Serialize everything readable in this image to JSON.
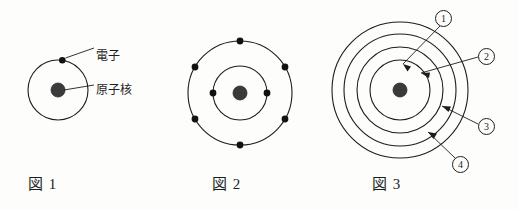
{
  "sheet": {
    "background_color": "#fdfdfc",
    "ink_color": "#1d1d1d",
    "width": 519,
    "height": 210
  },
  "figures": [
    {
      "id": "fig1",
      "caption": "図 1",
      "center": [
        58,
        90
      ],
      "nucleus_radius": 7,
      "shells": [
        {
          "radius": 30,
          "electrons": 1
        }
      ],
      "annotations": [
        {
          "id": "electron",
          "label": "電子",
          "target": "electron-dot"
        },
        {
          "id": "nucleus",
          "label": "原子核",
          "target": "nucleus-dot"
        }
      ]
    },
    {
      "id": "fig2",
      "caption": "図 2",
      "center": [
        240,
        93
      ],
      "nucleus_radius": 7,
      "shells": [
        {
          "radius": 27,
          "electrons": 2
        },
        {
          "radius": 52,
          "electrons": 6
        }
      ],
      "annotations": []
    },
    {
      "id": "fig3",
      "caption": "図 3",
      "center": [
        400,
        90
      ],
      "nucleus_radius": 7,
      "shells": [
        {
          "radius": 30,
          "electrons": 0
        },
        {
          "radius": 43,
          "electrons": 0
        },
        {
          "radius": 56,
          "electrons": 0
        },
        {
          "radius": 68,
          "electrons": 0
        }
      ],
      "annotations": [
        {
          "id": "shell-1",
          "label": "①",
          "number": "1",
          "target": "shell-ring-1"
        },
        {
          "id": "shell-2",
          "label": "②",
          "number": "2",
          "target": "shell-ring-2"
        },
        {
          "id": "shell-3",
          "label": "③",
          "number": "3",
          "target": "shell-ring-3"
        },
        {
          "id": "shell-4",
          "label": "④",
          "number": "4",
          "target": "shell-ring-4"
        }
      ]
    }
  ],
  "labels": {
    "electron": "電子",
    "nucleus": "原子核",
    "caption_fig1": "図 1",
    "caption_fig2": "図 2",
    "caption_fig3": "図 3",
    "shell_number_1": "1",
    "shell_number_2": "2",
    "shell_number_3": "3",
    "shell_number_4": "4"
  }
}
